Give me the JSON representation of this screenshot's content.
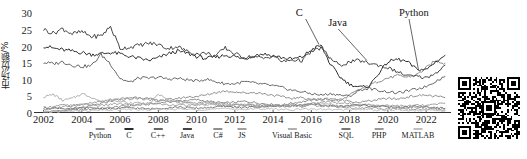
{
  "chart_data": {
    "type": "line",
    "title": "",
    "xlabel": "",
    "ylabel": "市场份额/%",
    "xlim": [
      2001.5,
      2023.3
    ],
    "ylim": [
      0,
      31
    ],
    "grid": false,
    "legend_position": "below-axis",
    "xticks": [
      2002,
      2004,
      2006,
      2008,
      2010,
      2012,
      2014,
      2016,
      2018,
      2020,
      2022
    ],
    "yticks": [
      0,
      5,
      10,
      15,
      20,
      25,
      30
    ],
    "annotations": [
      {
        "text": "C",
        "x": 2015.6,
        "y": 29.5
      },
      {
        "text": "Java",
        "x": 2017.3,
        "y": 26.5
      },
      {
        "text": "Python",
        "x": 2021.0,
        "y": 29.5
      }
    ],
    "x": [
      2002,
      2002.5,
      2003,
      2003.5,
      2004,
      2004.5,
      2005,
      2005.5,
      2006,
      2006.5,
      2007,
      2007.5,
      2008,
      2008.5,
      2009,
      2009.5,
      2010,
      2010.5,
      2011,
      2011.5,
      2012,
      2012.5,
      2013,
      2013.5,
      2014,
      2014.5,
      2015,
      2015.5,
      2016,
      2016.5,
      2017,
      2017.5,
      2018,
      2018.5,
      2019,
      2019.5,
      2020,
      2020.5,
      2021,
      2021.5,
      2022,
      2022.5,
      2023
    ],
    "series": [
      {
        "name": "Python",
        "color": "#8a8a8a",
        "values": [
          0.4,
          0.5,
          0.6,
          0.8,
          1.0,
          1.2,
          1.4,
          1.6,
          2.0,
          2.2,
          2.4,
          2.6,
          3.0,
          3.4,
          3.6,
          3.8,
          4.0,
          3.6,
          3.2,
          3.0,
          3.2,
          3.5,
          3.2,
          2.8,
          2.6,
          2.4,
          3.0,
          3.4,
          3.8,
          4.2,
          4.0,
          3.6,
          5.4,
          7.0,
          8.2,
          9.6,
          10.5,
          11.2,
          10.8,
          11.5,
          13.5,
          15.8,
          15.0
        ]
      },
      {
        "name": "C",
        "color": "#2b2b2b",
        "values": [
          20.2,
          19.5,
          19.0,
          18.6,
          18.2,
          17.6,
          17.8,
          18.2,
          17.8,
          17.0,
          16.4,
          15.8,
          16.6,
          17.8,
          18.6,
          18.0,
          17.0,
          16.4,
          16.8,
          17.4,
          17.0,
          16.2,
          17.4,
          17.8,
          17.2,
          16.6,
          16.2,
          16.8,
          19.0,
          20.4,
          14.6,
          10.8,
          8.6,
          7.8,
          8.0,
          11.8,
          15.4,
          16.2,
          15.4,
          13.2,
          13.0,
          15.4,
          17.4
        ]
      },
      {
        "name": "C++",
        "color": "#666666",
        "values": [
          15.2,
          14.8,
          15.4,
          14.4,
          14.0,
          14.2,
          17.6,
          14.8,
          10.4,
          9.2,
          10.6,
          10.4,
          10.8,
          10.2,
          10.4,
          10.0,
          9.6,
          10.2,
          9.4,
          8.8,
          8.8,
          9.4,
          9.0,
          8.6,
          8.2,
          7.6,
          6.8,
          6.4,
          5.8,
          5.4,
          5.8,
          5.4,
          5.0,
          6.8,
          7.4,
          6.8,
          6.4,
          6.0,
          6.6,
          7.2,
          8.0,
          9.6,
          11.0
        ]
      },
      {
        "name": "Java",
        "color": "#454545",
        "values": [
          25.2,
          24.0,
          25.4,
          23.8,
          24.4,
          23.0,
          23.2,
          26.0,
          19.4,
          19.8,
          20.4,
          21.0,
          20.6,
          19.4,
          20.0,
          18.6,
          17.8,
          18.0,
          17.2,
          19.6,
          17.8,
          16.8,
          17.0,
          16.4,
          17.2,
          15.4,
          16.0,
          15.8,
          18.4,
          19.6,
          16.4,
          14.2,
          15.4,
          15.8,
          15.0,
          14.4,
          13.6,
          12.4,
          11.2,
          11.0,
          10.6,
          12.0,
          14.4
        ]
      },
      {
        "name": "C#",
        "color": "#8f8f8f",
        "values": [
          0.2,
          0.4,
          0.6,
          1.2,
          1.6,
          2.2,
          2.8,
          3.6,
          4.2,
          4.6,
          4.8,
          4.2,
          3.8,
          4.0,
          4.4,
          4.8,
          5.0,
          5.4,
          6.2,
          6.6,
          6.4,
          6.0,
          6.2,
          5.8,
          5.4,
          4.8,
          4.4,
          4.6,
          4.2,
          4.0,
          4.4,
          4.0,
          3.6,
          3.2,
          3.6,
          4.0,
          4.4,
          4.2,
          4.8,
          5.2,
          5.4,
          5.0,
          4.6
        ]
      },
      {
        "name": "JS",
        "color": "#a0a0a0",
        "values": [
          1.6,
          2.0,
          2.4,
          2.2,
          2.6,
          2.4,
          2.2,
          2.6,
          2.8,
          2.4,
          2.6,
          3.0,
          2.8,
          2.4,
          2.6,
          2.2,
          2.4,
          2.8,
          2.6,
          2.2,
          2.4,
          2.6,
          2.2,
          2.0,
          2.2,
          2.4,
          2.6,
          2.4,
          2.8,
          3.2,
          3.4,
          3.0,
          2.8,
          2.6,
          2.4,
          2.2,
          2.4,
          2.2,
          2.0,
          2.4,
          2.2,
          2.6,
          3.0
        ]
      },
      {
        "name": "Visual Basic",
        "color": "#b0b0b0",
        "values": [
          4.8,
          5.6,
          3.8,
          4.4,
          5.8,
          4.8,
          3.4,
          4.2,
          3.6,
          2.8,
          3.2,
          2.6,
          5.6,
          4.4,
          3.0,
          2.8,
          2.6,
          2.4,
          2.6,
          2.2,
          2.0,
          2.2,
          2.0,
          1.8,
          2.0,
          2.4,
          2.2,
          2.0,
          2.4,
          2.8,
          2.6,
          2.2,
          2.0,
          2.4,
          2.6,
          2.2,
          2.0,
          1.8,
          1.6,
          1.8,
          1.6,
          1.4,
          1.2
        ]
      },
      {
        "name": "SQL",
        "color": "#777777",
        "values": [
          1.4,
          1.6,
          1.4,
          1.2,
          1.4,
          1.6,
          1.4,
          1.2,
          1.4,
          1.6,
          1.4,
          1.2,
          1.4,
          1.6,
          1.8,
          1.6,
          1.4,
          1.6,
          1.8,
          2.0,
          1.8,
          1.6,
          1.8,
          2.0,
          2.2,
          2.0,
          2.2,
          2.4,
          2.6,
          2.4,
          2.2,
          2.0,
          2.2,
          2.4,
          2.2,
          2.0,
          1.8,
          1.6,
          1.8,
          2.0,
          1.8,
          1.6,
          1.4
        ]
      },
      {
        "name": "PHP",
        "color": "#9a9a9a",
        "values": [
          1.0,
          1.4,
          1.8,
          2.2,
          2.6,
          3.0,
          3.4,
          3.8,
          4.0,
          4.2,
          4.4,
          4.0,
          3.8,
          3.6,
          3.4,
          3.2,
          3.0,
          3.2,
          3.0,
          2.8,
          2.6,
          2.4,
          2.6,
          2.4,
          2.2,
          2.0,
          2.2,
          2.0,
          2.4,
          2.2,
          2.0,
          1.8,
          1.6,
          1.4,
          1.6,
          1.4,
          1.2,
          1.4,
          1.2,
          1.0,
          1.2,
          1.0,
          0.8
        ]
      },
      {
        "name": "MATLAB",
        "color": "#c0c0c0",
        "values": [
          0.3,
          0.4,
          0.5,
          0.6,
          0.6,
          0.7,
          0.8,
          0.9,
          1.0,
          1.1,
          1.0,
          0.9,
          1.0,
          1.1,
          1.2,
          1.1,
          1.0,
          1.1,
          1.2,
          1.3,
          1.2,
          1.1,
          1.2,
          1.3,
          1.2,
          1.1,
          1.0,
          1.1,
          1.2,
          1.1,
          1.0,
          0.9,
          1.0,
          1.1,
          1.0,
          0.9,
          0.8,
          0.9,
          0.8,
          0.7,
          0.8,
          0.7,
          0.6
        ]
      }
    ]
  },
  "qr": {
    "label": "qr-code"
  }
}
